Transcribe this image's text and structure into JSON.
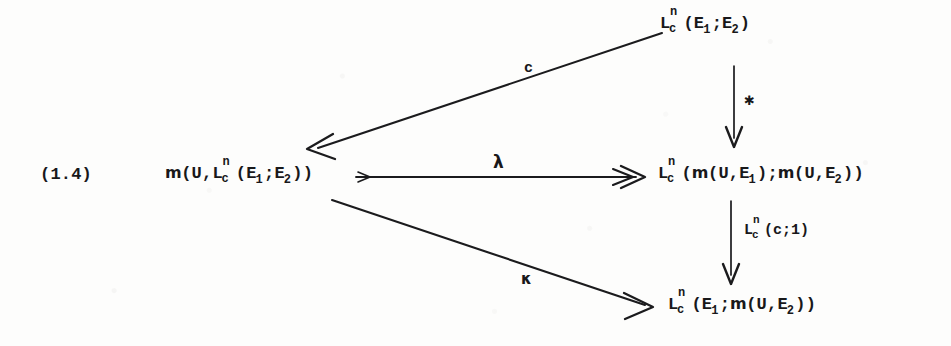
{
  "figure": {
    "equation_number": "(1.4)",
    "type": "commutative-diagram",
    "ink_color": "#1b1b1d",
    "background_color": "#fdfdfc"
  },
  "nodes": {
    "top_right": {
      "id": "node-top-right",
      "latex": "L_c^n(E_1;E_2)",
      "L": "L",
      "sup": "n",
      "sub": "c",
      "open": "(",
      "arg1_base": "E",
      "arg1_sub": "1",
      "sep": ";",
      "arg2_base": "E",
      "arg2_sub": "2",
      "close": ")"
    },
    "left": {
      "id": "node-left",
      "latex": "m(U,L_c^n(E_1;E_2))",
      "frak": "m",
      "prefix": "(U,",
      "L": "L",
      "sup": "n",
      "sub": "c",
      "open": "(",
      "arg1_base": "E",
      "arg1_sub": "1",
      "sep": ";",
      "arg2_base": "E",
      "arg2_sub": "2",
      "close": "))"
    },
    "middle_right": {
      "id": "node-middle-right",
      "latex": "L_c^n(m(U,E_1);m(U,E_2))",
      "L": "L",
      "sup": "n",
      "sub": "c",
      "open": "(",
      "frak1": "m",
      "arg1_pre": "(U,E",
      "arg1_sub": "1",
      "arg1_post": ")",
      "sep": ";",
      "frak2": "m",
      "arg2_pre": "(U,E",
      "arg2_sub": "2",
      "arg2_post": ")",
      "close": ")"
    },
    "bottom_right": {
      "id": "node-bottom-right",
      "latex": "L_c^n(E_1;m(U,E_2))",
      "L": "L",
      "sup": "n",
      "sub": "c",
      "open": "(",
      "arg1_base": "E",
      "arg1_sub": "1",
      "sep": ";",
      "frak2": "m",
      "arg2_pre": "(U,E",
      "arg2_sub": "2",
      "arg2_post": ")",
      "close": ")"
    }
  },
  "arrows": [
    {
      "id": "arrow-c",
      "from": "top_right",
      "to": "left",
      "label": "c",
      "style": "solid",
      "direction": "down-left"
    },
    {
      "id": "arrow-lambda",
      "from": "left",
      "to": "middle_right",
      "label": "λ",
      "style": "solid",
      "direction": "right",
      "head": "double-chevron"
    },
    {
      "id": "arrow-kappa",
      "from": "left",
      "to": "bottom_right",
      "label": "κ",
      "style": "solid",
      "direction": "down-right"
    },
    {
      "id": "arrow-star",
      "from": "top_right",
      "to": "middle_right",
      "label": "✱",
      "style": "solid",
      "direction": "down"
    },
    {
      "id": "arrow-lnc1",
      "from": "middle_right",
      "to": "bottom_right",
      "label_latex": "L_c^n(c;1)",
      "label_L": "L",
      "label_sup": "n",
      "label_sub": "c",
      "label_rest": "(c;1)",
      "style": "solid",
      "direction": "down"
    }
  ]
}
